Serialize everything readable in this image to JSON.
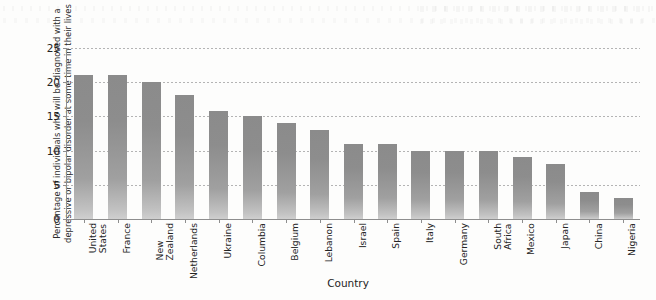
{
  "chart_data": {
    "type": "bar",
    "title": "",
    "xlabel": "Country",
    "ylabel": "Percentage of individuals who will be diagnosed with a\ndepressive or bipolar disorder at some time in their lives",
    "ylim": [
      0,
      25
    ],
    "yticks": [
      0,
      5,
      10,
      15,
      20,
      25
    ],
    "ytick_labels": [
      "0",
      "5",
      "10",
      "15",
      "20",
      "25"
    ],
    "grid": true,
    "legend": null,
    "bar_color": "#8b8b8b",
    "categories": [
      "United\nStates",
      "France",
      "New\nZealand",
      "Netherlands",
      "Ukraine",
      "Columbia",
      "Belgium",
      "Lebanon",
      "Israel",
      "Spain",
      "Italy",
      "Germany",
      "South\nAfrica",
      "Mexico",
      "Japan",
      "China",
      "Nigeria"
    ],
    "values": [
      21,
      21,
      20,
      18.2,
      15.8,
      15,
      14,
      13,
      11,
      11,
      10,
      10,
      10,
      9,
      8,
      4,
      3
    ]
  }
}
